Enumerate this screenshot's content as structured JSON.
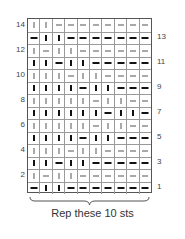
{
  "chart": {
    "columns": 10,
    "rows_count": 14,
    "legend_symbols": {
      "k_thin": "thin vertical bar",
      "k_bold": "bold vertical bar",
      "p_thin": "thin dash",
      "p_bold": "bold dash"
    },
    "rows": [
      {
        "num": "14",
        "side": "left",
        "cells": [
          "|",
          "|",
          "-",
          "-",
          "-",
          "-",
          "-",
          "-",
          "-",
          "-"
        ]
      },
      {
        "num": "13",
        "side": "right",
        "cells": [
          "-",
          "|",
          "|",
          "-",
          "-",
          "-",
          "-",
          "-",
          "-",
          "-"
        ]
      },
      {
        "num": "12",
        "side": "left",
        "cells": [
          "|",
          "-",
          "|",
          "|",
          "-",
          "-",
          "-",
          "-",
          "-",
          "-"
        ]
      },
      {
        "num": "11",
        "side": "right",
        "cells": [
          "|",
          "|",
          "-",
          "|",
          "|",
          "-",
          "-",
          "-",
          "-",
          "-"
        ]
      },
      {
        "num": "10",
        "side": "left",
        "cells": [
          "|",
          "|",
          "|",
          "-",
          "|",
          "|",
          "-",
          "-",
          "-",
          "-"
        ]
      },
      {
        "num": "9",
        "side": "right",
        "cells": [
          "|",
          "|",
          "|",
          "|",
          "-",
          "|",
          "|",
          "-",
          "-",
          "-"
        ]
      },
      {
        "num": "8",
        "side": "left",
        "cells": [
          "|",
          "|",
          "|",
          "|",
          "|",
          "-",
          "|",
          "|",
          "-",
          "-"
        ]
      },
      {
        "num": "7",
        "side": "right",
        "cells": [
          "|",
          "|",
          "|",
          "|",
          "|",
          "|",
          "-",
          "|",
          "|",
          "-"
        ]
      },
      {
        "num": "6",
        "side": "left",
        "cells": [
          "|",
          "|",
          "|",
          "|",
          "|",
          "-",
          "|",
          "|",
          "-",
          "-"
        ]
      },
      {
        "num": "5",
        "side": "right",
        "cells": [
          "|",
          "|",
          "|",
          "|",
          "-",
          "|",
          "|",
          "-",
          "-",
          "-"
        ]
      },
      {
        "num": "4",
        "side": "left",
        "cells": [
          "|",
          "|",
          "|",
          "-",
          "|",
          "|",
          "-",
          "-",
          "-",
          "-"
        ]
      },
      {
        "num": "3",
        "side": "right",
        "cells": [
          "|",
          "|",
          "-",
          "|",
          "|",
          "-",
          "-",
          "-",
          "-",
          "-"
        ]
      },
      {
        "num": "2",
        "side": "left",
        "cells": [
          "|",
          "-",
          "|",
          "|",
          "-",
          "-",
          "-",
          "-",
          "-",
          "-"
        ]
      },
      {
        "num": "1",
        "side": "right",
        "cells": [
          "-",
          "|",
          "|",
          "-",
          "-",
          "-",
          "-",
          "-",
          "-",
          "-"
        ]
      }
    ]
  },
  "caption": "Rep these 10 sts"
}
